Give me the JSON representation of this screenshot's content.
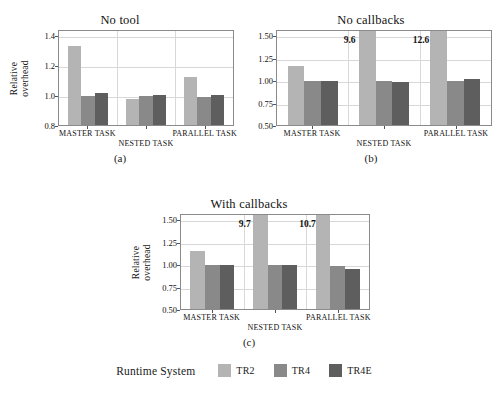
{
  "figure": {
    "legend": {
      "title": "Runtime System",
      "entries": [
        {
          "label": "TR2",
          "color": "#b4b4b4"
        },
        {
          "label": "TR4",
          "color": "#898989"
        },
        {
          "label": "TR4E",
          "color": "#5e5e5e"
        }
      ]
    },
    "panels": [
      {
        "letter": "(a)",
        "title": "No tool",
        "ylabel_lines": [
          "Relative",
          "overhead"
        ],
        "yticks": [
          "0.8",
          "1.0",
          "1.2",
          "1.4"
        ],
        "xticks": [
          "MASTER TASK",
          "NESTED TASK",
          "PARALLEL TASK"
        ]
      },
      {
        "letter": "(b)",
        "title": "No callbacks",
        "ylabel_lines": [],
        "yticks": [
          "0.50",
          "0.75",
          "1.00",
          "1.25",
          "1.50"
        ],
        "xticks": [
          "MASTER TASK",
          "NESTED TASK",
          "PARALLEL TASK"
        ]
      },
      {
        "letter": "(c)",
        "title": "With callbacks",
        "ylabel_lines": [
          "Relative",
          "overhead"
        ],
        "yticks": [
          "0.50",
          "0.75",
          "1.00",
          "1.25",
          "1.50"
        ],
        "xticks": [
          "MASTER TASK",
          "NESTED TASK",
          "PARALLEL TASK"
        ]
      }
    ]
  },
  "chart_data": [
    {
      "type": "bar",
      "title": "No tool",
      "panel": "(a)",
      "xlabel": "",
      "ylabel": "Relative overhead",
      "categories": [
        "MASTER TASK",
        "NESTED TASK",
        "PARALLEL TASK"
      ],
      "ytick_values": [
        0.8,
        1.0,
        1.2,
        1.4
      ],
      "ylim": [
        0.8,
        1.44
      ],
      "grid": true,
      "legend_position": "bottom-shared",
      "series": [
        {
          "name": "TR2",
          "color": "#b4b4b4",
          "values": [
            1.33,
            0.975,
            1.12
          ]
        },
        {
          "name": "TR4",
          "color": "#898989",
          "values": [
            0.995,
            0.995,
            0.99
          ]
        },
        {
          "name": "TR4E",
          "color": "#5e5e5e",
          "values": [
            1.015,
            1.0,
            1.0
          ]
        }
      ],
      "annotations": []
    },
    {
      "type": "bar",
      "title": "No callbacks",
      "panel": "(b)",
      "xlabel": "",
      "ylabel": "Relative overhead",
      "categories": [
        "MASTER TASK",
        "NESTED TASK",
        "PARALLEL TASK"
      ],
      "ytick_values": [
        0.5,
        0.75,
        1.0,
        1.25,
        1.5
      ],
      "ylim": [
        0.5,
        1.57
      ],
      "grid": true,
      "legend_position": "bottom-shared",
      "series": [
        {
          "name": "TR2",
          "color": "#b4b4b4",
          "values": [
            1.155,
            9.6,
            12.6
          ]
        },
        {
          "name": "TR4",
          "color": "#898989",
          "values": [
            0.995,
            0.995,
            0.995
          ]
        },
        {
          "name": "TR4E",
          "color": "#5e5e5e",
          "values": [
            0.99,
            0.975,
            1.015
          ]
        }
      ],
      "annotations": [
        {
          "text": "9.6",
          "series": "TR2",
          "category": "NESTED TASK",
          "clipped": true
        },
        {
          "text": "12.6",
          "series": "TR2",
          "category": "PARALLEL TASK",
          "clipped": true
        }
      ]
    },
    {
      "type": "bar",
      "title": "With callbacks",
      "panel": "(c)",
      "xlabel": "",
      "ylabel": "Relative overhead",
      "categories": [
        "MASTER TASK",
        "NESTED TASK",
        "PARALLEL TASK"
      ],
      "ytick_values": [
        0.5,
        0.75,
        1.0,
        1.25,
        1.5
      ],
      "ylim": [
        0.5,
        1.57
      ],
      "grid": true,
      "legend_position": "bottom-shared",
      "series": [
        {
          "name": "TR2",
          "color": "#b4b4b4",
          "values": [
            1.145,
            9.7,
            10.7
          ]
        },
        {
          "name": "TR4",
          "color": "#898989",
          "values": [
            0.995,
            0.995,
            0.985
          ]
        },
        {
          "name": "TR4E",
          "color": "#5e5e5e",
          "values": [
            0.99,
            0.995,
            0.945
          ]
        }
      ],
      "annotations": [
        {
          "text": "9.7",
          "series": "TR2",
          "category": "NESTED TASK",
          "clipped": true
        },
        {
          "text": "10.7",
          "series": "TR2",
          "category": "PARALLEL TASK",
          "clipped": true
        }
      ]
    }
  ]
}
